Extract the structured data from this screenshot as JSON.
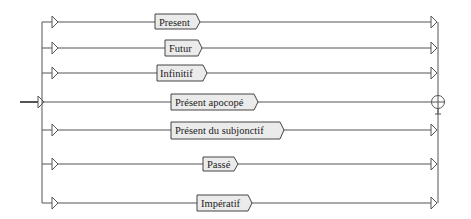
{
  "diagram": {
    "type": "syntax-railroad-graph",
    "entry": {
      "y": 102
    },
    "exit": {
      "symbol": "circled-cross-end",
      "y": 102
    },
    "branches": [
      {
        "label": "Present",
        "y": 22
      },
      {
        "label": "Futur",
        "y": 48
      },
      {
        "label": "Infinitif",
        "y": 73
      },
      {
        "label": "Présent apocopé",
        "y": 102
      },
      {
        "label": "Présent du subjonctif",
        "y": 130
      },
      {
        "label": "Passé",
        "y": 164
      },
      {
        "label": "Impératif",
        "y": 203
      }
    ]
  },
  "colors": {
    "line": "#555555",
    "box_fill": "#ebebeb",
    "box_border": "#444444",
    "text": "#1a1a1a"
  }
}
